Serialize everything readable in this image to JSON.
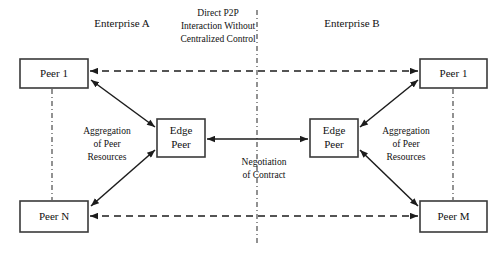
{
  "diagram": {
    "title_left": "Enterprise A",
    "title_right": "Enterprise B",
    "nodes": {
      "left_peer_top": "Peer 1",
      "left_peer_bottom": "Peer N",
      "left_edge_line1": "Edge",
      "left_edge_line2": "Peer",
      "right_edge_line1": "Edge",
      "right_edge_line2": "Peer",
      "right_peer_top": "Peer 1",
      "right_peer_bottom": "Peer M"
    },
    "annotations": {
      "p2p_line1": "Direct P2P",
      "p2p_line2": "Interaction Without",
      "p2p_line3": "Centralized Control",
      "agg_left_line1": "Aggregation",
      "agg_left_line2": "of Peer",
      "agg_left_line3": "Resources",
      "agg_right_line1": "Aggregation",
      "agg_right_line2": "of Peer",
      "agg_right_line3": "Resources",
      "negotiation_line1": "Negotiation",
      "negotiation_line2": "of Contract"
    },
    "colors": {
      "box_stroke": "#3a3a3a",
      "line": "#1c1c1c",
      "divider": "#4a4a4a",
      "text": "#111111",
      "background": "#ffffff"
    }
  }
}
